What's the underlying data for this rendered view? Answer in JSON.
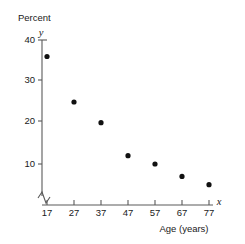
{
  "chart_data": {
    "type": "scatter",
    "title": "",
    "xlabel": "Age (years)",
    "ylabel": "Percent",
    "x_axis_variable": "x",
    "y_axis_variable": "y",
    "x": [
      17,
      27,
      37,
      47,
      57,
      67,
      77
    ],
    "values": [
      36,
      25,
      20,
      12,
      10,
      7,
      5
    ],
    "series": [
      {
        "name": "Percent by age",
        "points": [
          {
            "x": 17,
            "y": 36
          },
          {
            "x": 27,
            "y": 25
          },
          {
            "x": 37,
            "y": 20
          },
          {
            "x": 47,
            "y": 12
          },
          {
            "x": 57,
            "y": 10
          },
          {
            "x": 67,
            "y": 7
          },
          {
            "x": 77,
            "y": 5
          }
        ]
      }
    ],
    "xticks": [
      17,
      27,
      37,
      47,
      57,
      67,
      77
    ],
    "xtick_labels": [
      "17",
      "27",
      "37",
      "47",
      "57",
      "67",
      "77"
    ],
    "yticks": [
      10,
      20,
      30,
      40
    ],
    "ytick_labels": [
      "10",
      "20",
      "30",
      "40"
    ],
    "xlim": [
      12,
      82
    ],
    "ylim": [
      0,
      40
    ],
    "grid": false,
    "legend": null,
    "y_axis_break": true,
    "marker": "filled-circle",
    "marker_color": "#111111"
  },
  "labels": {
    "y_axis_title": "Percent",
    "y_axis_variable": "y",
    "x_axis_title": "Age (years)",
    "x_axis_variable": "x",
    "ytick_40": "40",
    "ytick_30": "30",
    "ytick_20": "20",
    "ytick_10": "10",
    "xtick_17": "17",
    "xtick_27": "27",
    "xtick_37": "37",
    "xtick_47": "47",
    "xtick_57": "57",
    "xtick_67": "67",
    "xtick_77": "77"
  }
}
